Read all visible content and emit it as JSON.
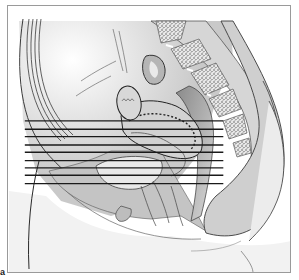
{
  "figure": {
    "panel_label": "a",
    "colors": {
      "background": "#ffffff",
      "frame_border": "#9a9a9a",
      "tissue_light": "#e6e6e6",
      "tissue_mid": "#bdbdbd",
      "tissue_dark": "#7a7a7a",
      "bone_speckle": "#555555",
      "outline": "#3a3a3a",
      "section_line": "#1a1a1a"
    },
    "section_lines": {
      "count": 9,
      "x_start": 22,
      "x_end": 212,
      "y_positions": [
        115,
        123,
        130,
        138,
        145,
        153,
        160,
        167,
        175
      ]
    },
    "structures": [
      {
        "name": "sacrum-vertebrae",
        "icon": "bone-segments"
      },
      {
        "name": "uterus",
        "icon": "organ-outline"
      },
      {
        "name": "bladder",
        "icon": "organ-outline"
      },
      {
        "name": "rectum",
        "icon": "organ-outline"
      },
      {
        "name": "anterior-abdominal-wall",
        "icon": "tissue-layers"
      },
      {
        "name": "buttock",
        "icon": "tissue-contour"
      }
    ]
  }
}
